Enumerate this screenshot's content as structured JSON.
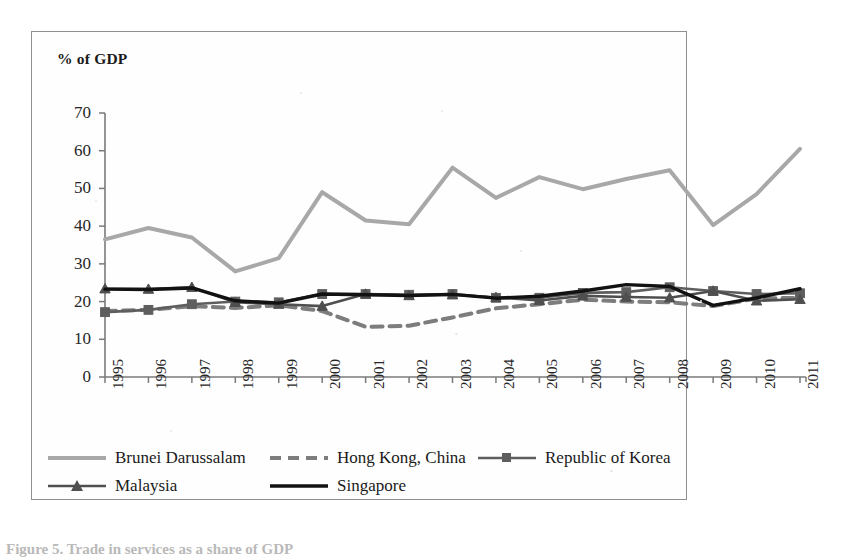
{
  "axis_title": "% of GDP",
  "caption_fragment": "Figure 5. Trade in services as a share of GDP",
  "colors": {
    "brunei": "#a8a8a8",
    "hongkong": "#7d7d7d",
    "korea": "#5e5e5e",
    "malaysia": "#4f4f4f",
    "singapore": "#121212",
    "axis": "#7a7a7a",
    "frame": "#8f8f8f"
  },
  "legend": {
    "rows": [
      [
        {
          "name": "Brunei Darussalam",
          "key": "brunei"
        },
        {
          "name": "Hong Kong, China",
          "key": "hongkong"
        },
        {
          "name": "Republic of Korea",
          "key": "korea"
        }
      ],
      [
        {
          "name": "Malaysia",
          "key": "malaysia"
        },
        {
          "name": "Singapore",
          "key": "singapore"
        }
      ]
    ]
  },
  "chart_data": {
    "type": "line",
    "title": "",
    "xlabel": "",
    "ylabel": "% of GDP",
    "ylim": [
      0,
      70
    ],
    "yticks": [
      0,
      10,
      20,
      30,
      40,
      50,
      60,
      70
    ],
    "grid": false,
    "legend_position": "bottom",
    "categories": [
      "1995",
      "1996",
      "1997",
      "1998",
      "1999",
      "2000",
      "2001",
      "2002",
      "2003",
      "2004",
      "2005",
      "2006",
      "2007",
      "2008",
      "2009",
      "2010",
      "2011"
    ],
    "series": [
      {
        "name": "Brunei Darussalam",
        "key": "brunei",
        "style": "solid-thick",
        "marker": "none",
        "values": [
          36.5,
          39.5,
          37.0,
          28.0,
          31.5,
          49.0,
          41.5,
          40.5,
          55.5,
          47.5,
          53.0,
          49.8,
          52.5,
          54.8,
          40.3,
          48.5,
          60.5
        ]
      },
      {
        "name": "Hong Kong, China",
        "key": "hongkong",
        "style": "dashed-thick",
        "marker": "none",
        "values": [
          17.5,
          17.8,
          18.8,
          18.3,
          19.0,
          17.5,
          13.3,
          13.6,
          15.8,
          18.2,
          19.3,
          20.5,
          20.0,
          19.8,
          18.8,
          20.8,
          21.0
        ]
      },
      {
        "name": "Republic of Korea",
        "key": "korea",
        "style": "solid",
        "marker": "square",
        "values": [
          17.2,
          17.8,
          19.3,
          20.0,
          19.8,
          22.0,
          22.0,
          21.8,
          22.0,
          21.0,
          21.0,
          22.3,
          22.5,
          23.8,
          22.8,
          22.0,
          22.2
        ]
      },
      {
        "name": "Malaysia",
        "key": "malaysia",
        "style": "solid",
        "marker": "triangle",
        "values": [
          23.4,
          23.3,
          23.8,
          19.8,
          19.3,
          18.8,
          22.0,
          21.6,
          21.8,
          21.1,
          20.3,
          21.5,
          21.2,
          21.0,
          22.8,
          20.2,
          20.6
        ]
      },
      {
        "name": "Singapore",
        "key": "singapore",
        "style": "solid-heavy",
        "marker": "none",
        "values": [
          23.3,
          23.2,
          23.6,
          20.2,
          19.6,
          22.0,
          21.8,
          21.6,
          21.9,
          20.9,
          21.4,
          22.8,
          24.5,
          24.0,
          19.0,
          21.0,
          23.4
        ]
      }
    ]
  }
}
